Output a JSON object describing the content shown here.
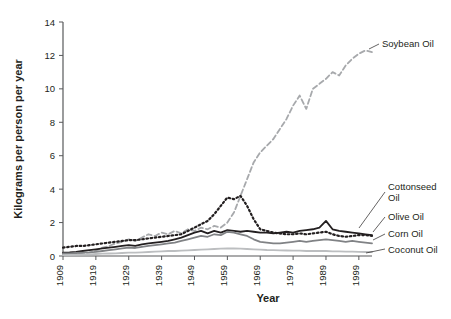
{
  "chart_data": {
    "type": "line",
    "title": "",
    "xlabel": "Year",
    "ylabel": "Kilograms per person per year",
    "xlim": [
      1909,
      2003
    ],
    "ylim": [
      0,
      14
    ],
    "grid": false,
    "legend_position": "inline-right-annotations",
    "x_ticks": [
      "1909",
      "1919",
      "1929",
      "1939",
      "1949",
      "1959",
      "1969",
      "1979",
      "1989",
      "1999"
    ],
    "x_tick_values": [
      1909,
      1919,
      1929,
      1939,
      1949,
      1959,
      1969,
      1979,
      1989,
      1999
    ],
    "y_ticks": [
      "0",
      "2",
      "4",
      "6",
      "8",
      "10",
      "12",
      "14"
    ],
    "y_tick_values": [
      0,
      2,
      4,
      6,
      8,
      10,
      12,
      14
    ],
    "x": [
      1909,
      1911,
      1913,
      1915,
      1917,
      1919,
      1921,
      1923,
      1925,
      1927,
      1929,
      1931,
      1933,
      1935,
      1937,
      1939,
      1941,
      1943,
      1945,
      1947,
      1949,
      1951,
      1953,
      1955,
      1957,
      1959,
      1961,
      1963,
      1965,
      1967,
      1969,
      1971,
      1973,
      1975,
      1977,
      1979,
      1981,
      1983,
      1985,
      1987,
      1989,
      1991,
      1993,
      1995,
      1997,
      1999,
      2001,
      2003
    ],
    "series": [
      {
        "name": "Soybean Oil",
        "label": "Soybean Oil",
        "color": "#a7a9ac",
        "style": "dashed",
        "values": [
          0.1,
          0.1,
          0.1,
          0.15,
          0.2,
          0.3,
          0.5,
          0.6,
          0.75,
          0.85,
          1.0,
          0.9,
          1.1,
          1.3,
          1.2,
          1.4,
          1.3,
          1.5,
          1.35,
          1.6,
          1.5,
          1.7,
          1.6,
          1.8,
          1.7,
          2.0,
          2.6,
          3.6,
          4.6,
          5.6,
          6.2,
          6.6,
          7.0,
          7.6,
          8.2,
          9.0,
          9.6,
          8.8,
          10.0,
          10.3,
          10.6,
          11.0,
          10.8,
          11.4,
          11.8,
          12.1,
          12.3,
          12.2
        ]
      },
      {
        "name": "Cottonseed Oil",
        "label": "Cottonseed Oil",
        "color": "#231f20",
        "style": "dotted",
        "values": [
          0.5,
          0.55,
          0.6,
          0.6,
          0.65,
          0.7,
          0.75,
          0.8,
          0.85,
          0.9,
          0.95,
          0.95,
          1.0,
          1.05,
          1.1,
          1.15,
          1.2,
          1.25,
          1.3,
          1.5,
          1.7,
          1.9,
          2.1,
          2.5,
          3.0,
          3.5,
          3.4,
          3.6,
          3.0,
          2.2,
          1.6,
          1.5,
          1.4,
          1.35,
          1.3,
          1.3,
          1.35,
          1.3,
          1.35,
          1.4,
          1.45,
          1.3,
          1.2,
          1.15,
          1.2,
          1.25,
          1.25,
          1.2
        ]
      },
      {
        "name": "Olive Oil",
        "label": "Olive Oil",
        "color": "#231f20",
        "style": "solid",
        "values": [
          0.2,
          0.22,
          0.25,
          0.3,
          0.35,
          0.4,
          0.45,
          0.5,
          0.55,
          0.6,
          0.65,
          0.6,
          0.7,
          0.75,
          0.8,
          0.85,
          0.9,
          1.0,
          1.1,
          1.25,
          1.4,
          1.5,
          1.35,
          1.5,
          1.4,
          1.55,
          1.5,
          1.45,
          1.5,
          1.45,
          1.4,
          1.4,
          1.35,
          1.4,
          1.45,
          1.4,
          1.5,
          1.55,
          1.6,
          1.7,
          2.1,
          1.6,
          1.5,
          1.45,
          1.4,
          1.35,
          1.3,
          1.25
        ]
      },
      {
        "name": "Corn Oil",
        "label": "Corn Oil",
        "color": "#808285",
        "style": "solid",
        "values": [
          0.15,
          0.16,
          0.18,
          0.2,
          0.22,
          0.25,
          0.3,
          0.35,
          0.4,
          0.45,
          0.5,
          0.48,
          0.55,
          0.6,
          0.65,
          0.7,
          0.75,
          0.8,
          0.9,
          1.0,
          1.1,
          1.2,
          1.15,
          1.3,
          1.25,
          1.45,
          1.4,
          1.3,
          1.2,
          1.0,
          0.85,
          0.8,
          0.75,
          0.75,
          0.8,
          0.85,
          0.9,
          0.85,
          0.9,
          0.95,
          1.0,
          0.95,
          0.9,
          0.85,
          0.9,
          0.85,
          0.8,
          0.75
        ]
      },
      {
        "name": "Coconut Oil",
        "label": "Coconut Oil",
        "color": "#bcbec0",
        "style": "solid",
        "values": [
          0.05,
          0.06,
          0.07,
          0.08,
          0.1,
          0.12,
          0.14,
          0.15,
          0.16,
          0.18,
          0.2,
          0.2,
          0.22,
          0.24,
          0.26,
          0.28,
          0.3,
          0.3,
          0.32,
          0.34,
          0.36,
          0.38,
          0.4,
          0.42,
          0.44,
          0.46,
          0.45,
          0.44,
          0.42,
          0.4,
          0.38,
          0.36,
          0.35,
          0.34,
          0.33,
          0.32,
          0.32,
          0.3,
          0.3,
          0.3,
          0.3,
          0.28,
          0.28,
          0.26,
          0.26,
          0.25,
          0.24,
          0.24
        ]
      }
    ],
    "annotations": [
      {
        "text": "Soybean Oil",
        "series": "Soybean Oil"
      },
      {
        "text": "Cottonseed Oil",
        "series": "Cottonseed Oil"
      },
      {
        "text": "Olive Oil",
        "series": "Olive Oil"
      },
      {
        "text": "Corn Oil",
        "series": "Corn Oil"
      },
      {
        "text": "Coconut Oil",
        "series": "Coconut Oil"
      }
    ]
  },
  "labels": {
    "soybean": "Soybean Oil",
    "cottonseed_line1": "Cottonseed",
    "cottonseed_line2": "Oil",
    "olive": "Olive Oil",
    "corn": "Corn Oil",
    "coconut": "Coconut Oil",
    "xaxis": "Year",
    "yaxis": "Kilograms per person per year"
  },
  "colors": {
    "soybean": "#a7a9ac",
    "cottonseed": "#231f20",
    "olive": "#231f20",
    "corn": "#808285",
    "coconut": "#bcbec0",
    "axis": "#58595b",
    "text": "#231f20",
    "background": "#ffffff"
  }
}
